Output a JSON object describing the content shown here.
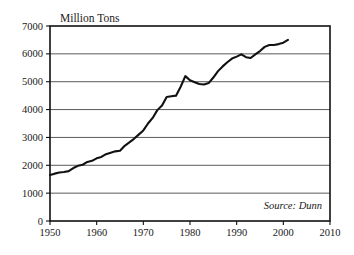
{
  "chart_data": {
    "type": "line",
    "title": "",
    "subtitle": "",
    "xlabel": "",
    "ylabel": "Million Tons",
    "ylabel_position": "above-axis-top",
    "xlim": [
      1950,
      2010
    ],
    "ylim": [
      0,
      7000
    ],
    "grid": "horizontal",
    "legend": "none",
    "annotations": [
      {
        "name": "source-note",
        "text": "Source: Dunn",
        "style": "italic",
        "position": "inside-bottom-right"
      }
    ],
    "x_ticks": [
      1950,
      1960,
      1970,
      1980,
      1990,
      2000,
      2010
    ],
    "x_tick_labels": [
      "1950",
      "1960",
      "1970",
      "1980",
      "1990",
      "2000",
      "2010"
    ],
    "y_ticks": [
      0,
      1000,
      2000,
      3000,
      4000,
      5000,
      6000,
      7000
    ],
    "y_tick_labels": [
      "0",
      "1000",
      "2000",
      "3000",
      "4000",
      "5000",
      "6000",
      "7000"
    ],
    "line_color": "#111111",
    "grid_color": "#5a5a5a",
    "axis_color": "#111111",
    "plot_background": "#ffffff",
    "series": [
      {
        "name": "World Grain Production",
        "x": [
          1950,
          1951,
          1952,
          1953,
          1954,
          1955,
          1956,
          1957,
          1958,
          1959,
          1960,
          1961,
          1962,
          1963,
          1964,
          1965,
          1966,
          1967,
          1968,
          1969,
          1970,
          1971,
          1972,
          1973,
          1974,
          1975,
          1976,
          1977,
          1978,
          1979,
          1980,
          1981,
          1982,
          1983,
          1984,
          1985,
          1986,
          1987,
          1988,
          1989,
          1990,
          1991,
          1992,
          1993,
          1994,
          1995,
          1996,
          1997,
          1998,
          1999,
          2000,
          2001
        ],
        "values": [
          1650,
          1700,
          1740,
          1760,
          1790,
          1900,
          1980,
          2020,
          2120,
          2160,
          2250,
          2300,
          2400,
          2450,
          2500,
          2520,
          2700,
          2820,
          2950,
          3100,
          3250,
          3500,
          3700,
          3980,
          4150,
          4450,
          4480,
          4500,
          4820,
          5200,
          5050,
          4980,
          4920,
          4900,
          4950,
          5150,
          5380,
          5550,
          5700,
          5830,
          5900,
          5980,
          5880,
          5850,
          5980,
          6100,
          6250,
          6320,
          6320,
          6350,
          6400,
          6500
        ]
      }
    ]
  },
  "axis": {
    "y_title": "Million Tons"
  },
  "source": {
    "text": "Source: Dunn"
  }
}
